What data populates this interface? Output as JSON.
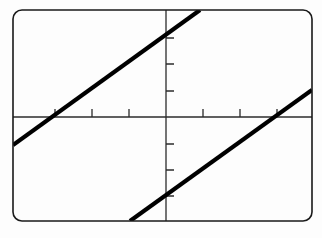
{
  "screen": {
    "name": "graphing-calculator-plot",
    "background_color": "#fdfdfd",
    "frame": {
      "stroke_color": "#1a1a1a",
      "stroke_width": 1.6,
      "corner_radius": 9,
      "x": 13,
      "y": 10,
      "width": 299,
      "height": 211
    }
  },
  "chart_data": {
    "type": "line",
    "title": "",
    "subtitle": "",
    "xlabel": "",
    "ylabel": "",
    "grid": false,
    "legend": "none",
    "axis_color": "#2b2b2b",
    "axis_stroke_width": 1.3,
    "curve_color": "#000000",
    "curve_stroke_width": 4.2,
    "origin_px": {
      "x": 166,
      "y": 117
    },
    "pixels_per_unit": {
      "x": 37,
      "y": 26.3
    },
    "xlim": [
      -4.14,
      3.95
    ],
    "ylim": [
      -3.95,
      4.07
    ],
    "xtick_interval": 1,
    "ytick_interval": 1,
    "xticks": [
      -3,
      -2,
      -1,
      1,
      2,
      3
    ],
    "yticks": [
      -3,
      -2,
      -1,
      1,
      2,
      3
    ],
    "xtick_px": [
      55,
      92,
      129,
      203,
      240,
      277
    ],
    "ytick_px": [
      38,
      64,
      91,
      144,
      170,
      196
    ],
    "tick_length": 8,
    "tick_side_x": "above-axis",
    "tick_side_y": "right-of-axis",
    "series": [
      {
        "name": "upper-line",
        "slope": 0.712,
        "intercept": 2.0,
        "x_at_y0": -2.81,
        "endpoints_px": [
          {
            "x": 13,
            "y": 145
          },
          {
            "x": 200,
            "y": 10
          }
        ]
      },
      {
        "name": "lower-line",
        "slope": 0.712,
        "intercept": -2.95,
        "x_at_y0": 4.14,
        "endpoints_px": [
          {
            "x": 130,
            "y": 221
          },
          {
            "x": 312,
            "y": 90
          }
        ]
      }
    ]
  }
}
